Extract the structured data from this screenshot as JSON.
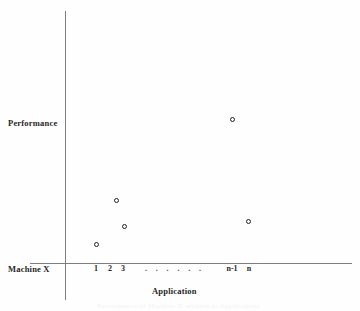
{
  "figure": {
    "axis_color": "#7d7d7d",
    "point_color": "#1f1f1f",
    "background": "#ffffff",
    "machine_label": "Machine X",
    "ghost_caption": "Performance of Machine X relative to Applications"
  },
  "chart_data": {
    "type": "scatter",
    "title": "",
    "xlabel": "Application",
    "ylabel": "Performance",
    "grid": false,
    "legend": false,
    "xlim": [
      0,
      1
    ],
    "ylim": [
      0,
      1
    ],
    "tick_labels": [
      "1",
      "2",
      "3",
      ". . . . . .",
      "n-1",
      "n"
    ],
    "dots_label": ". . . . . .",
    "categories": [
      "1",
      "2",
      "3",
      "n-1",
      "n"
    ],
    "points": [
      {
        "label": "1",
        "x": 96,
        "y": 244
      },
      {
        "label": "2",
        "x": 116,
        "y": 200
      },
      {
        "label": "3",
        "x": 124,
        "y": 226
      },
      {
        "label": "n-1",
        "x": 232,
        "y": 119
      },
      {
        "label": "n",
        "x": 248,
        "y": 221
      }
    ],
    "values": [
      0.08,
      0.25,
      0.15,
      0.57,
      0.17
    ]
  }
}
